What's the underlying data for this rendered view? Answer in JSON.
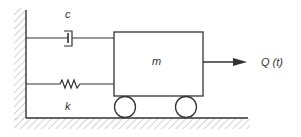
{
  "diagram": {
    "type": "single-degree-of-freedom mass-spring-damper system",
    "labels": {
      "damper": "c",
      "spring": "k",
      "mass": "m",
      "force": "Q (t)"
    },
    "colors": {
      "stroke": "#333333",
      "hatch": "#aaaaaa",
      "background": "#ffffff"
    }
  }
}
